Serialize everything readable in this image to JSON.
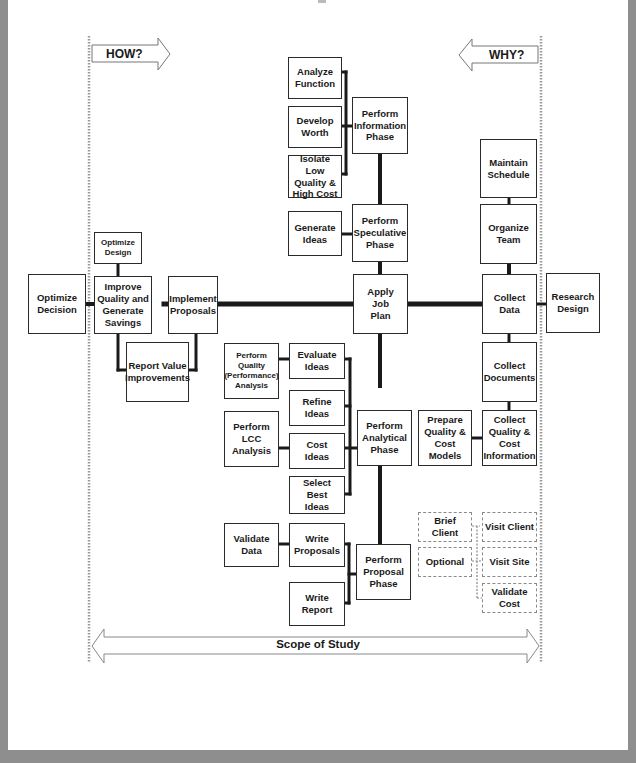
{
  "diagram": {
    "type": "FAST diagram (Function Analysis System Technique)",
    "direction_labels": {
      "how": "HOW?",
      "why": "WHY?"
    },
    "scope_label": "Scope of Study",
    "colors": {
      "frame": "#8e8e8e",
      "page": "#ffffff",
      "line": "#1a1a1a",
      "boundary": "#9a9a9a"
    }
  },
  "boxes": {
    "optimize_decision": "Optimize\nDecision",
    "optimize_design": "Optimize\nDesign",
    "improve_quality": "Improve\nQuality and\nGenerate\nSavings",
    "report_value": "Report Value\nImprovements",
    "implement_proposals": "Implement\nProposals",
    "analyze_function": "Analyze\nFunction",
    "develop_worth": "Develop\nWorth",
    "isolate_low": "Isolate Low\nQuality &\nHigh Cost",
    "info_phase": "Perform\nInformation\nPhase",
    "generate_ideas": "Generate\nIdeas",
    "speculative_phase": "Perform\nSpeculative\nPhase",
    "apply_job_plan": "Apply\nJob\nPlan",
    "perform_quality": "Perform\nQuality\n(Performance)\nAnalysis",
    "evaluate_ideas": "Evaluate\nIdeas",
    "refine_ideas": "Refine\nIdeas",
    "perform_lcc": "Perform\nLCC\nAnalysis",
    "cost_ideas": "Cost\nIdeas",
    "select_best": "Select\nBest\nIdeas",
    "analytical_phase": "Perform\nAnalytical\nPhase",
    "validate_data": "Validate\nData",
    "write_proposals": "Write\nProposals",
    "write_report": "Write\nReport",
    "proposal_phase": "Perform\nProposal\nPhase",
    "maintain_schedule": "Maintain\nSchedule",
    "organize_team": "Organize\nTeam",
    "collect_data": "Collect\nData",
    "research_design": "Research\nDesign",
    "collect_documents": "Collect\nDocuments",
    "prepare_models": "Prepare\nQuality &\nCost\nModels",
    "collect_quality_cost": "Collect\nQuality &\nCost\nInformation",
    "brief_client": "Brief Client",
    "optional": "Optional",
    "visit_client": "Visit Client",
    "visit_site": "Visit Site",
    "validate_cost": "Validate\nCost"
  }
}
